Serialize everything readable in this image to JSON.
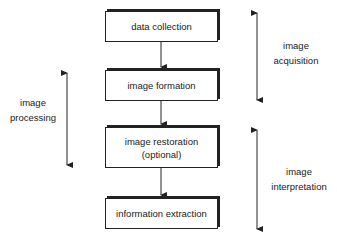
{
  "diagram": {
    "steps": [
      {
        "label": "data collection"
      },
      {
        "label": "image formation"
      },
      {
        "label": "image restoration",
        "sub": "(optional)"
      },
      {
        "label": "information extraction"
      }
    ],
    "ranges": {
      "acquisition": {
        "line1": "image",
        "line2": "acquisition"
      },
      "processing": {
        "line1": "image",
        "line2": "processing"
      },
      "interpretation": {
        "line1": "image",
        "line2": "interpretation"
      }
    }
  }
}
